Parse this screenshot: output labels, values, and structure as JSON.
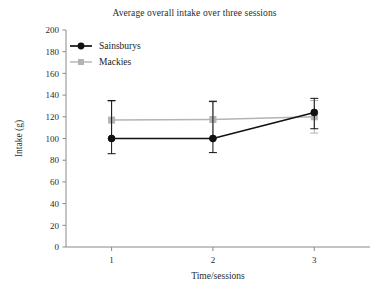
{
  "chart_data": {
    "type": "line",
    "title": "Average overall intake over three sessions",
    "xlabel": "Time/sessions",
    "ylabel": "Intake (g)",
    "categories": [
      "1",
      "2",
      "3"
    ],
    "x": [
      1,
      2,
      3
    ],
    "xlim": [
      0.55,
      3.55
    ],
    "ylim": [
      0,
      200
    ],
    "ytick_labels": [
      "0",
      "20",
      "40",
      "60",
      "80",
      "100",
      "120",
      "140",
      "160",
      "180",
      "200"
    ],
    "yticks": [
      0,
      20,
      40,
      60,
      80,
      100,
      120,
      140,
      160,
      180,
      200
    ],
    "xtick_labels": [
      "1",
      "2",
      "3"
    ],
    "grid": false,
    "legend_position": "top-left",
    "series": [
      {
        "name": "Sainsburys",
        "color": "#111111",
        "marker": "circle",
        "values": [
          100,
          100,
          124
        ],
        "error_low": [
          86,
          87,
          109
        ],
        "error_high": [
          135,
          134,
          137
        ]
      },
      {
        "name": "Mackies",
        "color": "#b3b3b3",
        "marker": "square",
        "values": [
          117,
          117.5,
          120
        ],
        "error_low": [
          100,
          101,
          105
        ],
        "error_high": [
          134,
          135,
          135
        ]
      }
    ]
  },
  "legend": {
    "items": [
      {
        "label": "Sainsburys"
      },
      {
        "label": "Mackies"
      }
    ]
  },
  "colors": {
    "series_primary": "#111111",
    "series_secondary": "#b3b3b3",
    "axis": "#8a8a8a",
    "text": "#2b2b2b",
    "background": "#ffffff"
  }
}
